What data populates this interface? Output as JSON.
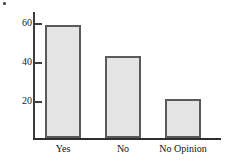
{
  "chart_data": {
    "type": "bar",
    "title": "",
    "subtitle": "",
    "xlabel": "",
    "ylabel": "",
    "categories": [
      "Yes",
      "No",
      "No Opinion"
    ],
    "values": [
      58,
      42,
      20
    ],
    "series": [
      {
        "name": "Responses",
        "values": [
          58,
          42,
          20
        ]
      }
    ],
    "ylim": [
      0,
      66
    ],
    "yticks": [
      20,
      40,
      60
    ],
    "ytick_labels": [
      "20",
      "40",
      "60"
    ],
    "grid": false,
    "legend": false,
    "legend_position": "none",
    "annotations": [],
    "bar_fill_color": "#e4e4e4",
    "bar_edge_color": "#5a5a5a",
    "axis_color": "#3d3d3d",
    "background_color": "#ffffff"
  },
  "axis": {
    "y_ticks": [
      {
        "label": "60",
        "value": 60
      },
      {
        "label": "40",
        "value": 40
      },
      {
        "label": "20",
        "value": 20
      }
    ]
  },
  "bars": [
    {
      "label": "Yes",
      "value": 58
    },
    {
      "label": "No",
      "value": 42
    },
    {
      "label": "No Opinion",
      "value": 20
    }
  ],
  "marks": {
    "corner_dot": "figure-corner-mark"
  }
}
